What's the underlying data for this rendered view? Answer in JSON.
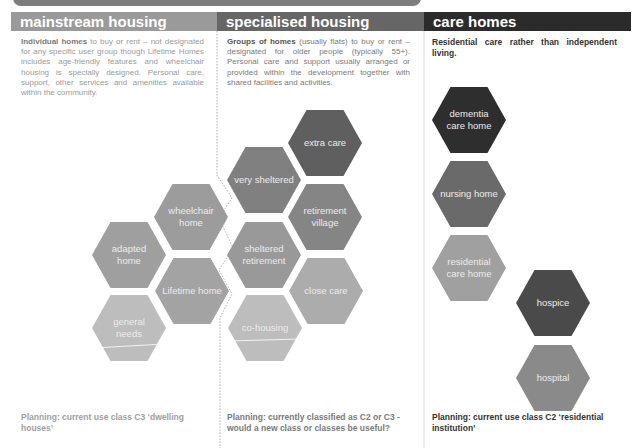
{
  "colors": {
    "mainstream_header": "#9a9a9a",
    "specialised_header": "#666666",
    "care_header": "#2b2b2b",
    "top_band": "#7d7d7d"
  },
  "columns": [
    {
      "title": "mainstream housing",
      "intro_bold": "Individual homes",
      "intro_rest": " to buy or rent – not designated for any specific user group though Lifetime Homes includes age-friendly features and wheelchair housing is specially designed.  Personal care, support, other services and amenities available within the community.",
      "planning": "Planning: current use class C3 ‘dwelling houses’"
    },
    {
      "title": "specialised housing",
      "intro_bold": "Groups of homes",
      "intro_rest": " (usually flats) to buy or rent – designated for older people (typically 55+). Personal care and support usually arranged or provided within the development together with shared facilities and activities.",
      "planning": "Planning: currently classified as C2 or C3 - would a new class or classes be useful?"
    },
    {
      "title": "care homes",
      "intro_bold": "Residential care rather than independent living.",
      "intro_rest": "",
      "planning": "Planning: current use class C2 ‘residential institution’"
    }
  ],
  "hexagons": [
    {
      "label": "wheelchair home",
      "color": "#9c9c9c"
    },
    {
      "label": "adapted home",
      "color": "#9f9f9f"
    },
    {
      "label": "Lifetime home",
      "color": "#a3a3a3"
    },
    {
      "label": "general needs",
      "color": "#bdbdbd"
    },
    {
      "label": "extra care",
      "color": "#5f5f5f"
    },
    {
      "label": "very sheltered",
      "color": "#808080"
    },
    {
      "label": "retirement village",
      "color": "#858585"
    },
    {
      "label": "sheltered retirement",
      "color": "#999999"
    },
    {
      "label": "close care",
      "color": "#acacac"
    },
    {
      "label": "co-housing",
      "color": "#bdbdbd"
    },
    {
      "label": "dementia care home",
      "color": "#2e2e2e"
    },
    {
      "label": "nursing home",
      "color": "#6a6a6a"
    },
    {
      "label": "residential care home",
      "color": "#a0a0a0"
    },
    {
      "label": "hospice",
      "color": "#4a4a4a"
    },
    {
      "label": "hospital",
      "color": "#8a8a8a"
    }
  ]
}
